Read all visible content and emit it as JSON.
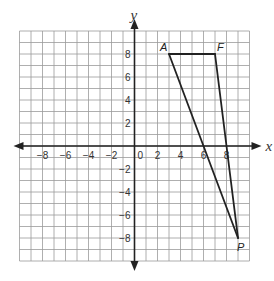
{
  "diagram": {
    "type": "coordinate-plane",
    "grid": {
      "min": -10,
      "max": 10,
      "step": 1
    },
    "axes": {
      "x_label": "x",
      "y_label": "y",
      "origin_label": "0",
      "x_ticks": [
        {
          "value": -8,
          "label": "−8"
        },
        {
          "value": -6,
          "label": "−6"
        },
        {
          "value": -4,
          "label": "−4"
        },
        {
          "value": -2,
          "label": "−2"
        },
        {
          "value": 2,
          "label": "2"
        },
        {
          "value": 4,
          "label": "4"
        },
        {
          "value": 6,
          "label": "6"
        },
        {
          "value": 8,
          "label": "8"
        }
      ],
      "y_ticks": [
        {
          "value": 8,
          "label": "8"
        },
        {
          "value": 6,
          "label": "6"
        },
        {
          "value": 4,
          "label": "4"
        },
        {
          "value": 2,
          "label": "2"
        },
        {
          "value": -2,
          "label": "−2"
        },
        {
          "value": -4,
          "label": "−4"
        },
        {
          "value": -6,
          "label": "−6"
        },
        {
          "value": -8,
          "label": "−8"
        }
      ]
    },
    "points": [
      {
        "name": "A",
        "x": 3,
        "y": 8
      },
      {
        "name": "F",
        "x": 7,
        "y": 8
      },
      {
        "name": "P",
        "x": 9,
        "y": -8
      }
    ],
    "segments": [
      [
        "A",
        "F"
      ],
      [
        "F",
        "P"
      ],
      [
        "P",
        "A"
      ]
    ],
    "colors": {
      "grid": "#9a9a9a",
      "axis": "#222222",
      "shape": "#222222"
    }
  }
}
